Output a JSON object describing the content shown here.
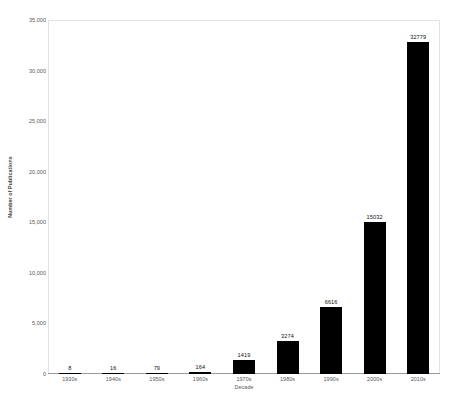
{
  "chart_data": {
    "type": "bar",
    "title": "",
    "xlabel": "Decade",
    "ylabel": "Number of Publications",
    "categories": [
      "1930s",
      "1940s",
      "1950s",
      "1960s",
      "1970s",
      "1980s",
      "1990s",
      "2000s",
      "2010s"
    ],
    "values": [
      8,
      16,
      79,
      164,
      1419,
      3274,
      6616,
      15032,
      32779
    ],
    "value_labels": [
      "8",
      "16",
      "79",
      "164",
      "1419",
      "3274",
      "6616",
      "15032",
      "32779"
    ],
    "ylim": [
      0,
      35000
    ],
    "ytick_values": [
      0,
      5000,
      10000,
      15000,
      20000,
      25000,
      30000,
      35000
    ],
    "ytick_labels": [
      "0",
      "5,000",
      "10,000",
      "15,000",
      "20,000",
      "25,000",
      "30,000",
      "35,000"
    ],
    "grid": false,
    "legend": false,
    "bar_color": "#000000",
    "plot_border_color": "#e2e2e2",
    "axis_line_color": "#9a9a9a",
    "text_color": "#555555"
  }
}
